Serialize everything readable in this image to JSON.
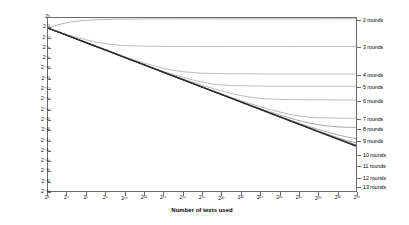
{
  "chart_data": {
    "type": "line",
    "title": "",
    "xlabel": "Number of texts used",
    "ylabel": "Squared distance between output and uniform distribution",
    "x_scale": "log2",
    "y_scale": "log2",
    "xlim": [
      2,
      34
    ],
    "ylim": [
      -34,
      0
    ],
    "grid": false,
    "legend_position": "right-inline",
    "x_tick_labels": [
      "2²",
      "2⁴",
      "2⁶",
      "2⁸",
      "2¹⁰",
      "2¹²",
      "2¹⁴",
      "2¹⁶",
      "2¹⁸",
      "2²⁰",
      "2²²",
      "2²⁴",
      "2²⁶",
      "2²⁸",
      "2³⁰",
      "2³²",
      "2³⁴"
    ],
    "x_tick_exponents": [
      2,
      4,
      6,
      8,
      10,
      12,
      14,
      16,
      18,
      20,
      22,
      24,
      26,
      28,
      30,
      32,
      34
    ],
    "y_tick_labels": [
      "2⁰",
      "2⁻²",
      "2⁻⁴",
      "2⁻⁶",
      "2⁻⁸",
      "2⁻¹⁰",
      "2⁻¹²",
      "2⁻¹⁴",
      "2⁻¹⁶",
      "2⁻¹⁸",
      "2⁻²⁰",
      "2⁻²²",
      "2⁻²⁴",
      "2⁻²⁶",
      "2⁻²⁸",
      "2⁻³⁰",
      "2⁻³²",
      "2⁻³⁴"
    ],
    "y_tick_exponents": [
      0,
      -2,
      -4,
      -6,
      -8,
      -10,
      -12,
      -14,
      -16,
      -18,
      -20,
      -22,
      -24,
      -26,
      -28,
      -30,
      -32,
      -34
    ],
    "series": [
      {
        "name": "2 rounds",
        "label_y_exponent": -0.6,
        "plateau_y_exponent": -0.15,
        "knee_x_exponent": 7,
        "color": "#808080",
        "points": [
          [
            2,
            -2.0
          ],
          [
            3,
            -1.35
          ],
          [
            4,
            -0.9
          ],
          [
            5,
            -0.62
          ],
          [
            6,
            -0.45
          ],
          [
            7,
            -0.34
          ],
          [
            9,
            -0.24
          ],
          [
            12,
            -0.19
          ],
          [
            16,
            -0.17
          ],
          [
            22,
            -0.16
          ],
          [
            28,
            -0.155
          ],
          [
            34,
            -0.15
          ]
        ]
      },
      {
        "name": "3 rounds",
        "label_y_exponent": -5.9,
        "plateau_y_exponent": -5.6,
        "knee_x_exponent": 12,
        "color": "#909090",
        "points": [
          [
            2,
            -2.0
          ],
          [
            3,
            -2.65
          ],
          [
            4,
            -3.25
          ],
          [
            5,
            -3.8
          ],
          [
            6,
            -4.3
          ],
          [
            7,
            -4.72
          ],
          [
            8,
            -5.05
          ],
          [
            9,
            -5.28
          ],
          [
            10,
            -5.43
          ],
          [
            12,
            -5.54
          ],
          [
            15,
            -5.58
          ],
          [
            20,
            -5.6
          ],
          [
            27,
            -5.6
          ],
          [
            34,
            -5.6
          ]
        ]
      },
      {
        "name": "4 rounds",
        "label_y_exponent": -11.2,
        "plateau_y_exponent": -11.0,
        "knee_x_exponent": 16,
        "color": "#909090",
        "points": [
          [
            2,
            -2.0
          ],
          [
            3,
            -2.7
          ],
          [
            4,
            -3.4
          ],
          [
            5,
            -4.1
          ],
          [
            6,
            -4.8
          ],
          [
            7,
            -5.5
          ],
          [
            8,
            -6.2
          ],
          [
            9,
            -6.9
          ],
          [
            10,
            -7.6
          ],
          [
            11,
            -8.25
          ],
          [
            12,
            -8.85
          ],
          [
            13,
            -9.4
          ],
          [
            14,
            -9.88
          ],
          [
            15,
            -10.25
          ],
          [
            16,
            -10.55
          ],
          [
            18,
            -10.85
          ],
          [
            21,
            -10.97
          ],
          [
            26,
            -11.0
          ],
          [
            34,
            -11.0
          ]
        ]
      },
      {
        "name": "5 rounds",
        "label_y_exponent": -13.6,
        "plateau_y_exponent": -13.4,
        "knee_x_exponent": 18,
        "color": "#909090",
        "points": [
          [
            2,
            -2.0
          ],
          [
            3,
            -2.7
          ],
          [
            4,
            -3.4
          ],
          [
            5,
            -4.1
          ],
          [
            6,
            -4.82
          ],
          [
            7,
            -5.55
          ],
          [
            8,
            -6.28
          ],
          [
            9,
            -7.0
          ],
          [
            10,
            -7.72
          ],
          [
            11,
            -8.45
          ],
          [
            12,
            -9.15
          ],
          [
            13,
            -9.85
          ],
          [
            14,
            -10.5
          ],
          [
            15,
            -11.1
          ],
          [
            16,
            -11.65
          ],
          [
            17,
            -12.15
          ],
          [
            18,
            -12.6
          ],
          [
            19,
            -12.95
          ],
          [
            20,
            -13.15
          ],
          [
            22,
            -13.33
          ],
          [
            25,
            -13.4
          ],
          [
            30,
            -13.4
          ],
          [
            34,
            -13.4
          ]
        ]
      },
      {
        "name": "6 rounds",
        "label_y_exponent": -16.3,
        "plateau_y_exponent": -16.1,
        "knee_x_exponent": 21,
        "color": "#909090",
        "points": [
          [
            2,
            -2.0
          ],
          [
            4,
            -3.42
          ],
          [
            6,
            -4.85
          ],
          [
            8,
            -6.3
          ],
          [
            10,
            -7.75
          ],
          [
            12,
            -9.2
          ],
          [
            14,
            -10.6
          ],
          [
            15,
            -11.3
          ],
          [
            16,
            -11.95
          ],
          [
            17,
            -12.6
          ],
          [
            18,
            -13.2
          ],
          [
            19,
            -13.78
          ],
          [
            20,
            -14.32
          ],
          [
            21,
            -14.8
          ],
          [
            22,
            -15.22
          ],
          [
            23,
            -15.55
          ],
          [
            24,
            -15.8
          ],
          [
            26,
            -16.0
          ],
          [
            29,
            -16.08
          ],
          [
            34,
            -16.1
          ]
        ]
      },
      {
        "name": "7 rounds",
        "label_y_exponent": -19.9,
        "plateau_y_exponent": -19.7,
        "knee_x_exponent": 24,
        "color": "#8a8a8a",
        "points": [
          [
            2,
            -2.0
          ],
          [
            4,
            -3.42
          ],
          [
            6,
            -4.86
          ],
          [
            8,
            -6.3
          ],
          [
            10,
            -7.75
          ],
          [
            12,
            -9.2
          ],
          [
            14,
            -10.65
          ],
          [
            16,
            -12.08
          ],
          [
            18,
            -13.5
          ],
          [
            19,
            -14.2
          ],
          [
            20,
            -14.88
          ],
          [
            21,
            -15.55
          ],
          [
            22,
            -16.2
          ],
          [
            23,
            -16.82
          ],
          [
            24,
            -17.4
          ],
          [
            25,
            -17.95
          ],
          [
            26,
            -18.45
          ],
          [
            27,
            -18.88
          ],
          [
            28,
            -19.22
          ],
          [
            29,
            -19.46
          ],
          [
            30,
            -19.6
          ],
          [
            32,
            -19.68
          ],
          [
            34,
            -19.7
          ]
        ]
      },
      {
        "name": "8 rounds",
        "label_y_exponent": -21.7,
        "plateau_y_exponent": -21.5,
        "knee_x_exponent": 26,
        "color": "#8a8a8a",
        "points": [
          [
            2,
            -2.0
          ],
          [
            4,
            -3.42
          ],
          [
            6,
            -4.86
          ],
          [
            8,
            -6.3
          ],
          [
            10,
            -7.75
          ],
          [
            12,
            -9.2
          ],
          [
            14,
            -10.65
          ],
          [
            16,
            -12.1
          ],
          [
            18,
            -13.55
          ],
          [
            20,
            -15.0
          ],
          [
            21,
            -15.7
          ],
          [
            22,
            -16.4
          ],
          [
            23,
            -17.08
          ],
          [
            24,
            -17.75
          ],
          [
            25,
            -18.4
          ],
          [
            26,
            -19.02
          ],
          [
            27,
            -19.6
          ],
          [
            28,
            -20.12
          ],
          [
            29,
            -20.58
          ],
          [
            30,
            -20.95
          ],
          [
            31,
            -21.22
          ],
          [
            32,
            -21.38
          ],
          [
            33,
            -21.47
          ],
          [
            34,
            -21.5
          ]
        ]
      },
      {
        "name": "9 rounds",
        "label_y_exponent": -24.1,
        "plateau_y_exponent": -23.9,
        "knee_x_exponent": 29,
        "color": "#8a8a8a",
        "points": [
          [
            2,
            -2.0
          ],
          [
            4,
            -3.42
          ],
          [
            6,
            -4.86
          ],
          [
            8,
            -6.3
          ],
          [
            10,
            -7.75
          ],
          [
            12,
            -9.2
          ],
          [
            14,
            -10.65
          ],
          [
            16,
            -12.1
          ],
          [
            18,
            -13.55
          ],
          [
            20,
            -15.0
          ],
          [
            22,
            -16.45
          ],
          [
            24,
            -17.88
          ],
          [
            25,
            -18.58
          ],
          [
            26,
            -19.28
          ],
          [
            27,
            -19.96
          ],
          [
            28,
            -20.62
          ],
          [
            29,
            -21.26
          ],
          [
            30,
            -21.86
          ],
          [
            31,
            -22.42
          ],
          [
            32,
            -22.92
          ],
          [
            33,
            -23.35
          ],
          [
            34,
            -23.7
          ]
        ]
      },
      {
        "name": "10 rounds",
        "label_y_exponent": -26.8,
        "plateau_y_exponent": -26.6,
        "knee_x_exponent": 31,
        "color": "#8a8a8a",
        "points": [
          [
            2,
            -2.0
          ],
          [
            4,
            -3.42
          ],
          [
            6,
            -4.86
          ],
          [
            8,
            -6.3
          ],
          [
            10,
            -7.75
          ],
          [
            12,
            -9.2
          ],
          [
            14,
            -10.65
          ],
          [
            16,
            -12.1
          ],
          [
            18,
            -13.55
          ],
          [
            20,
            -15.0
          ],
          [
            22,
            -16.45
          ],
          [
            24,
            -17.9
          ],
          [
            26,
            -19.34
          ],
          [
            28,
            -20.76
          ],
          [
            29,
            -21.46
          ],
          [
            30,
            -22.15
          ],
          [
            31,
            -22.82
          ],
          [
            32,
            -23.46
          ],
          [
            33,
            -24.05
          ],
          [
            34,
            -24.55
          ]
        ]
      },
      {
        "name": "11 rounds",
        "label_y_exponent": -29.0,
        "plateau_y_exponent": -28.8,
        "knee_x_exponent": 33,
        "color": "#8a8a8a",
        "points": [
          [
            2,
            -2.0
          ],
          [
            4,
            -3.42
          ],
          [
            6,
            -4.86
          ],
          [
            8,
            -6.3
          ],
          [
            10,
            -7.75
          ],
          [
            12,
            -9.2
          ],
          [
            14,
            -10.65
          ],
          [
            16,
            -12.1
          ],
          [
            18,
            -13.55
          ],
          [
            20,
            -15.0
          ],
          [
            22,
            -16.45
          ],
          [
            24,
            -17.9
          ],
          [
            26,
            -19.35
          ],
          [
            28,
            -20.8
          ],
          [
            30,
            -22.22
          ],
          [
            31,
            -22.92
          ],
          [
            32,
            -23.6
          ],
          [
            33,
            -24.26
          ],
          [
            34,
            -24.88
          ]
        ]
      },
      {
        "name": "12 rounds",
        "label_y_exponent": -31.3,
        "plateau_y_exponent": -31.1,
        "knee_x_exponent": 34,
        "color": "#555555",
        "points": [
          [
            2,
            -2.0
          ],
          [
            4,
            -3.43
          ],
          [
            6,
            -4.87
          ],
          [
            8,
            -6.31
          ],
          [
            10,
            -7.76
          ],
          [
            12,
            -9.21
          ],
          [
            14,
            -10.66
          ],
          [
            16,
            -12.11
          ],
          [
            18,
            -13.56
          ],
          [
            20,
            -15.01
          ],
          [
            22,
            -16.46
          ],
          [
            24,
            -17.91
          ],
          [
            26,
            -19.36
          ],
          [
            28,
            -20.81
          ],
          [
            30,
            -22.26
          ],
          [
            32,
            -23.7
          ],
          [
            33,
            -24.42
          ],
          [
            34,
            -25.12
          ]
        ]
      },
      {
        "name": "13 rounds",
        "label_y_exponent": -33.1,
        "plateau_y_exponent": -32.9,
        "knee_x_exponent": 34,
        "color": "#2b2b2b",
        "points": [
          [
            2,
            -2.0
          ],
          [
            4,
            -3.44
          ],
          [
            6,
            -4.88
          ],
          [
            8,
            -6.32
          ],
          [
            10,
            -7.77
          ],
          [
            12,
            -9.22
          ],
          [
            14,
            -10.67
          ],
          [
            16,
            -12.12
          ],
          [
            18,
            -13.57
          ],
          [
            20,
            -15.02
          ],
          [
            22,
            -16.47
          ],
          [
            24,
            -17.92
          ],
          [
            26,
            -19.37
          ],
          [
            28,
            -20.82
          ],
          [
            30,
            -22.27
          ],
          [
            32,
            -23.72
          ],
          [
            34,
            -25.16
          ]
        ]
      }
    ]
  },
  "axes": {
    "x_title": "Number of texts used",
    "y_title": "Squared distance between output and uniform distribution"
  },
  "colors": {
    "frame": "#6a6a6a",
    "background": "#ffffff",
    "text": "#000000",
    "primary_curve": "#2b2b2b",
    "secondary_curve": "#909090"
  }
}
